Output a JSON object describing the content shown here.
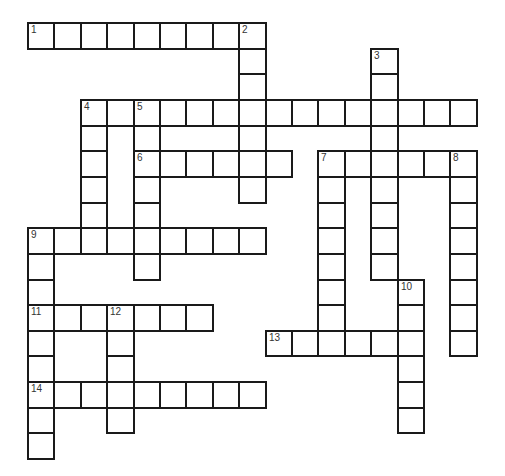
{
  "puzzle": {
    "grid": {
      "origin_x": 28,
      "origin_y": 23,
      "cell_w": 26.4,
      "cell_h": 25.65,
      "rows": 17,
      "cols": 17
    },
    "entries": [
      {
        "number": 1,
        "direction": "across",
        "row": 0,
        "col": 0,
        "length": 9
      },
      {
        "number": 2,
        "direction": "down",
        "row": 0,
        "col": 8,
        "length": 7
      },
      {
        "number": 3,
        "direction": "down",
        "row": 1,
        "col": 13,
        "length": 9
      },
      {
        "number": 4,
        "direction": "across",
        "row": 3,
        "col": 2,
        "length": 15
      },
      {
        "number": 4,
        "direction": "down",
        "row": 3,
        "col": 2,
        "length": 6
      },
      {
        "number": 5,
        "direction": "down",
        "row": 3,
        "col": 4,
        "length": 7
      },
      {
        "number": 6,
        "direction": "across",
        "row": 5,
        "col": 4,
        "length": 6
      },
      {
        "number": 7,
        "direction": "across",
        "row": 5,
        "col": 11,
        "length": 6
      },
      {
        "number": 7,
        "direction": "down",
        "row": 5,
        "col": 11,
        "length": 8
      },
      {
        "number": 8,
        "direction": "down",
        "row": 5,
        "col": 16,
        "length": 8
      },
      {
        "number": 9,
        "direction": "across",
        "row": 8,
        "col": 0,
        "length": 9
      },
      {
        "number": 9,
        "direction": "down",
        "row": 8,
        "col": 0,
        "length": 9
      },
      {
        "number": 10,
        "direction": "down",
        "row": 10,
        "col": 14,
        "length": 6
      },
      {
        "number": 11,
        "direction": "across",
        "row": 11,
        "col": 0,
        "length": 7
      },
      {
        "number": 12,
        "direction": "down",
        "row": 11,
        "col": 3,
        "length": 5
      },
      {
        "number": 13,
        "direction": "across",
        "row": 12,
        "col": 9,
        "length": 6
      },
      {
        "number": 14,
        "direction": "across",
        "row": 14,
        "col": 0,
        "length": 9
      }
    ],
    "cell_values": {},
    "colors": {
      "border": "#1a1a1a",
      "cell_bg": "#ffffff",
      "number": "#333333"
    }
  }
}
